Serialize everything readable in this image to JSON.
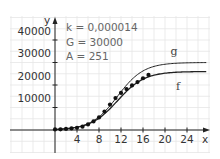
{
  "chart_data": {
    "type": "line",
    "title": "",
    "xlabel": "x",
    "ylabel": "y",
    "xlim": [
      -8,
      28
    ],
    "ylim": [
      -10000,
      50000
    ],
    "grid": true,
    "x_ticks": [
      4,
      8,
      12,
      16,
      20,
      24
    ],
    "y_ticks": [
      10000,
      20000,
      30000,
      40000
    ],
    "x_tick_labels": [
      "4",
      "8",
      "12",
      "16",
      "20",
      "24"
    ],
    "y_tick_labels": [
      "10000",
      "20000",
      "30000",
      "40000"
    ],
    "annotations": [
      "k = 0,000014",
      "G = 30000",
      "A = 251"
    ],
    "params": {
      "k": 1.4e-05,
      "G": 30000,
      "A": 251
    },
    "series": [
      {
        "name": "g",
        "kind": "curve",
        "label": "g",
        "asymptote": 30000,
        "x": [
          0,
          2,
          4,
          6,
          8,
          10,
          12,
          14,
          16,
          18,
          20,
          22,
          24,
          26
        ],
        "values": [
          251,
          610,
          1460,
          3360,
          7100,
          12900,
          19400,
          24600,
          27700,
          29100,
          29650,
          29870,
          29950,
          29980
        ]
      },
      {
        "name": "f",
        "kind": "curve",
        "label": "f",
        "asymptote": 26000,
        "x": [
          0,
          2,
          4,
          6,
          8,
          10,
          12,
          14,
          16,
          18,
          20,
          22,
          24,
          26
        ],
        "values": [
          251,
          600,
          1430,
          3250,
          6800,
          12200,
          18000,
          22300,
          24600,
          25500,
          25850,
          25950,
          25990,
          26000
        ]
      },
      {
        "name": "data",
        "kind": "points",
        "x": [
          0,
          1,
          2,
          3,
          4,
          5,
          6,
          7,
          8,
          9,
          10,
          11,
          12,
          13,
          14,
          15,
          16,
          17
        ],
        "values": [
          251,
          300,
          500,
          700,
          1000,
          1500,
          2500,
          3800,
          5600,
          8200,
          11300,
          14200,
          16500,
          18200,
          19800,
          21300,
          23000,
          24500
        ]
      }
    ]
  },
  "labels": {
    "y_axis": "y",
    "x_axis": "x",
    "curve_g": "g",
    "curve_f": "f",
    "param_k": "k = 0,000014",
    "param_G": "G = 30000",
    "param_A": "A = 251",
    "ytick_40000": "40000",
    "ytick_30000": "30000",
    "ytick_20000": "20000",
    "ytick_10000": "10000",
    "xtick_4": "4",
    "xtick_8": "8",
    "xtick_12": "12",
    "xtick_16": "16",
    "xtick_20": "20",
    "xtick_24": "24"
  },
  "colors": {
    "grid": "#e6e6e6",
    "axis": "#222222",
    "curve": "#222222",
    "points": "#111111"
  }
}
